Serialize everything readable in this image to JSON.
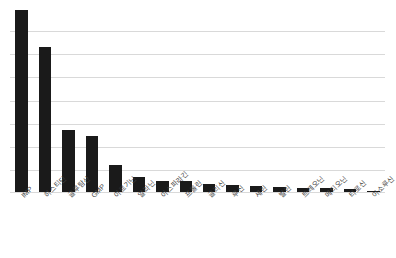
{
  "chart_data": {
    "type": "bar",
    "title": "",
    "subtitle": "",
    "xlabel": "",
    "ylabel": "",
    "grid": true,
    "legend": false,
    "axis_tick_labels_visible": false,
    "gridline_count": 7,
    "ylim": [
      0,
      7.7
    ],
    "categories": [
      "IMP",
      "히스티딘",
      "글루탐산",
      "GMP",
      "아르기닌",
      "알라닌",
      "아스파라긴",
      "프롤린",
      "글리신",
      "루신",
      "세린",
      "발린",
      "트레오닌",
      "메티오닌",
      "티로신",
      "이소루신"
    ],
    "values": [
      7.63,
      6.08,
      2.63,
      2.38,
      1.17,
      0.67,
      0.5,
      0.5,
      0.38,
      0.33,
      0.29,
      0.25,
      0.21,
      0.21,
      0.17,
      0.08
    ],
    "bar_color": "#1a1a1a",
    "gridline_color": "#d9d9d9",
    "background_color": "#ffffff",
    "label_color": "#3f3f3f",
    "label_rotation_degrees": -45
  }
}
